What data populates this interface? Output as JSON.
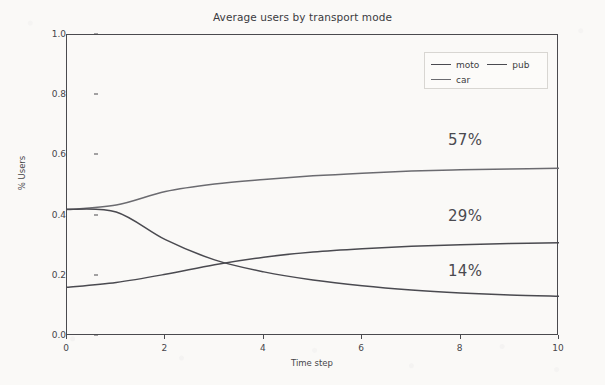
{
  "chart_data": {
    "type": "line",
    "title": "Average users by transport mode",
    "xlabel": "Time step",
    "ylabel": "% Users",
    "xlim": [
      0,
      10
    ],
    "ylim": [
      0.0,
      1.0
    ],
    "xticks": [
      0,
      2,
      4,
      6,
      8,
      10
    ],
    "xtick_labels": [
      "0",
      "2",
      "4",
      "6",
      "8",
      "10"
    ],
    "yticks": [
      0.0,
      0.2,
      0.4,
      0.6,
      0.8,
      1.0
    ],
    "ytick_labels": [
      "0.0",
      "0.2",
      "0.4",
      "0.6",
      "0.8",
      "1.0"
    ],
    "grid": false,
    "legend_position": "upper right",
    "x": [
      0,
      1,
      2,
      3,
      4,
      5,
      6,
      7,
      8,
      9,
      10
    ],
    "series": [
      {
        "name": "car",
        "color": "#6b6b70",
        "values": [
          0.42,
          0.435,
          0.48,
          0.505,
          0.52,
          0.532,
          0.541,
          0.548,
          0.552,
          0.555,
          0.557
        ]
      },
      {
        "name": "moto",
        "color": "#4a4a50",
        "values": [
          0.162,
          0.178,
          0.205,
          0.237,
          0.262,
          0.279,
          0.29,
          0.298,
          0.303,
          0.307,
          0.31
        ]
      },
      {
        "name": "pub",
        "color": "#4a4a50",
        "values": [
          0.421,
          0.412,
          0.32,
          0.253,
          0.213,
          0.186,
          0.167,
          0.153,
          0.143,
          0.136,
          0.132
        ]
      }
    ],
    "annotations": [
      {
        "text": "57%",
        "x_px": 448,
        "y_px": 131,
        "series": "car"
      },
      {
        "text": "29%",
        "x_px": 448,
        "y_px": 207,
        "series": "moto"
      },
      {
        "text": "14%",
        "x_px": 448,
        "y_px": 262,
        "series": "pub"
      }
    ],
    "legend_entries": [
      {
        "label": "moto",
        "color": "#4a4a50"
      },
      {
        "label": "pub",
        "color": "#4a4a50"
      },
      {
        "label": "car",
        "color": "#6b6b70"
      }
    ]
  },
  "colors": {
    "background": "#faf9f7",
    "axis": "#4a4a4e",
    "text": "#3b3b3f",
    "annotation": "#4a4a50"
  }
}
